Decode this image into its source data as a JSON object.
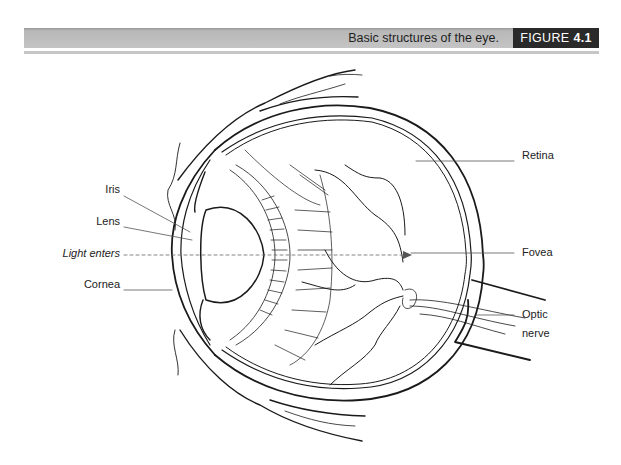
{
  "header": {
    "caption": "Basic structures of the eye.",
    "figure_word": "FIGURE",
    "figure_number": "4.1"
  },
  "diagram": {
    "title": "Basic structures of the eye",
    "labels_left": [
      {
        "id": "iris",
        "text": "Iris"
      },
      {
        "id": "lens",
        "text": "Lens"
      },
      {
        "id": "light",
        "text": "Light enters"
      },
      {
        "id": "cornea",
        "text": "Cornea"
      }
    ],
    "labels_right": [
      {
        "id": "retina",
        "text": "Retina"
      },
      {
        "id": "fovea",
        "text": "Fovea"
      },
      {
        "id": "optic",
        "text": "Optic",
        "text2": "nerve"
      }
    ]
  }
}
